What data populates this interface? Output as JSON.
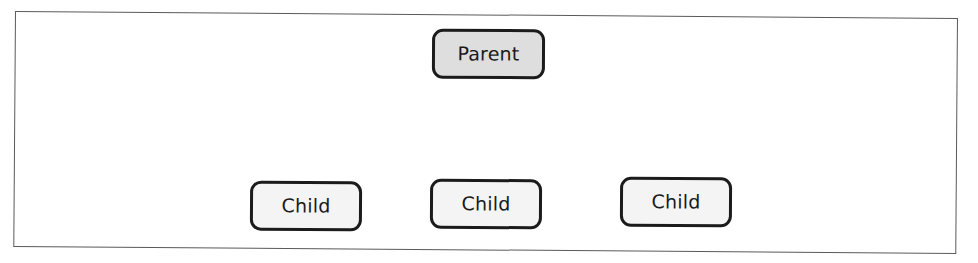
{
  "figure": {
    "frame": {
      "name": "container-frame"
    },
    "nodes": [
      {
        "id": "parent",
        "label": "Parent",
        "role": "parent-node",
        "fill": "#dedede",
        "border": "#1b1b1b"
      },
      {
        "id": "child-1",
        "label": "Child",
        "role": "child-node",
        "fill": "#f4f4f4",
        "border": "#1b1b1b"
      },
      {
        "id": "child-2",
        "label": "Child",
        "role": "child-node",
        "fill": "#f4f4f4",
        "border": "#1b1b1b"
      },
      {
        "id": "child-3",
        "label": "Child",
        "role": "child-node",
        "fill": "#f4f4f4",
        "border": "#1b1b1b"
      }
    ]
  }
}
